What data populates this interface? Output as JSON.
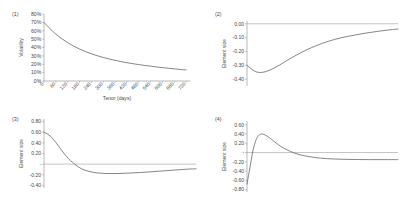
{
  "figure": {
    "background": "#ffffff",
    "curve_color": "#5c5c5c",
    "axis_color": "#8a8a8a",
    "text_color": "#4a4a4a"
  },
  "panels": [
    {
      "tag": "(1)",
      "ylabel": "Volatility",
      "xlabel": "Tenor (days)",
      "yticks": [
        "80%",
        "70%",
        "60%",
        "50%",
        "40%",
        "30%",
        "20%",
        "10%",
        "0%"
      ],
      "xticks": [
        "0",
        "60",
        "120",
        "180",
        "240",
        "300",
        "360",
        "420",
        "480",
        "540",
        "600",
        "660",
        "720"
      ]
    },
    {
      "tag": "(2)",
      "ylabel": "Element size",
      "xlabel": "",
      "yticks": [
        "0.00",
        "-0.10",
        "-0.20",
        "-0.30",
        "-0.40"
      ],
      "xticks": []
    },
    {
      "tag": "(3)",
      "ylabel": "Element size",
      "xlabel": "",
      "yticks": [
        "0.80",
        "0.60",
        "0.40",
        "0.20",
        "-",
        "-0.20",
        "-0.40"
      ],
      "xticks": []
    },
    {
      "tag": "(4)",
      "ylabel": "Element size",
      "xlabel": "",
      "yticks": [
        "0.60",
        "0.40",
        "0.20",
        "-",
        "-0.20",
        "-0.40",
        "-0.60",
        "-0.80"
      ],
      "xticks": []
    }
  ],
  "chart_data": [
    {
      "type": "line",
      "panel": "(1)",
      "title": "",
      "xlabel": "Tenor (days)",
      "ylabel": "Volatility",
      "xlim": [
        0,
        740
      ],
      "ylim": [
        0,
        0.8
      ],
      "yticks": [
        0,
        0.1,
        0.2,
        0.3,
        0.4,
        0.5,
        0.6,
        0.7,
        0.8
      ],
      "ytick_labels": [
        "0%",
        "10%",
        "20%",
        "30%",
        "40%",
        "50%",
        "60%",
        "70%",
        "80%"
      ],
      "xticks": [
        0,
        60,
        120,
        180,
        240,
        300,
        360,
        420,
        480,
        540,
        600,
        660,
        720
      ],
      "xtick_labels": [
        "0",
        "60",
        "120",
        "180",
        "240",
        "300",
        "360",
        "420",
        "480",
        "540",
        "600",
        "660",
        "720"
      ],
      "grid": false,
      "legend": null,
      "series": [
        {
          "name": "volatility term structure",
          "x": [
            0,
            30,
            60,
            90,
            120,
            150,
            180,
            210,
            240,
            270,
            300,
            330,
            360,
            390,
            420,
            450,
            480,
            510,
            540,
            570,
            600,
            630,
            660,
            690,
            720
          ],
          "values": [
            0.7,
            0.625,
            0.56,
            0.505,
            0.458,
            0.418,
            0.382,
            0.352,
            0.325,
            0.302,
            0.281,
            0.263,
            0.247,
            0.232,
            0.219,
            0.207,
            0.196,
            0.186,
            0.177,
            0.168,
            0.16,
            0.152,
            0.145,
            0.138,
            0.132
          ]
        }
      ]
    },
    {
      "type": "line",
      "panel": "(2)",
      "title": "",
      "xlabel": "",
      "ylabel": "Element size",
      "xlim": [
        0,
        740
      ],
      "ylim": [
        -0.45,
        0.02
      ],
      "yticks": [
        0.0,
        -0.1,
        -0.2,
        -0.3,
        -0.4
      ],
      "ytick_labels": [
        "0.00",
        "-0.10",
        "-0.20",
        "-0.30",
        "-0.40"
      ],
      "grid": false,
      "legend": null,
      "zeroline": 0.0,
      "series": [
        {
          "name": "element size curve 2",
          "x": [
            0,
            20,
            40,
            60,
            80,
            100,
            130,
            160,
            200,
            240,
            290,
            340,
            400,
            460,
            520,
            580,
            640,
            700,
            740
          ],
          "values": [
            -0.3,
            -0.325,
            -0.345,
            -0.352,
            -0.35,
            -0.342,
            -0.322,
            -0.298,
            -0.262,
            -0.228,
            -0.19,
            -0.158,
            -0.126,
            -0.102,
            -0.084,
            -0.068,
            -0.055,
            -0.044,
            -0.038
          ]
        }
      ]
    },
    {
      "type": "line",
      "panel": "(3)",
      "title": "",
      "xlabel": "",
      "ylabel": "Element size",
      "xlim": [
        0,
        740
      ],
      "ylim": [
        -0.45,
        0.85
      ],
      "yticks": [
        0.8,
        0.6,
        0.4,
        0.2,
        0.0,
        -0.2,
        -0.4
      ],
      "ytick_labels": [
        "0.80",
        "0.60",
        "0.40",
        "0.20",
        "-",
        "-0.20",
        "-0.40"
      ],
      "grid": false,
      "legend": null,
      "zeroline": 0.0,
      "series": [
        {
          "name": "element size curve 3",
          "x": [
            0,
            20,
            40,
            60,
            80,
            100,
            120,
            140,
            170,
            200,
            240,
            290,
            350,
            410,
            470,
            530,
            590,
            650,
            700,
            740
          ],
          "values": [
            0.6,
            0.56,
            0.49,
            0.395,
            0.29,
            0.19,
            0.1,
            0.03,
            -0.06,
            -0.115,
            -0.155,
            -0.175,
            -0.178,
            -0.17,
            -0.158,
            -0.142,
            -0.125,
            -0.108,
            -0.095,
            -0.088
          ]
        }
      ]
    },
    {
      "type": "line",
      "panel": "(4)",
      "title": "",
      "xlabel": "",
      "ylabel": "Element size",
      "xlim": [
        0,
        740
      ],
      "ylim": [
        -0.85,
        0.68
      ],
      "yticks": [
        0.6,
        0.4,
        0.2,
        0.0,
        -0.2,
        -0.4,
        -0.6,
        -0.8
      ],
      "ytick_labels": [
        "0.60",
        "0.40",
        "0.20",
        "-",
        "-0.20",
        "-0.40",
        "-0.60",
        "-0.80"
      ],
      "grid": false,
      "legend": null,
      "zeroline": 0.0,
      "series": [
        {
          "name": "element size curve 4",
          "x": [
            0,
            10,
            20,
            30,
            45,
            60,
            75,
            90,
            110,
            130,
            155,
            180,
            215,
            250,
            300,
            360,
            420,
            480,
            540,
            600,
            660,
            720,
            740
          ],
          "values": [
            -0.68,
            -0.43,
            -0.18,
            0.06,
            0.28,
            0.38,
            0.4,
            0.375,
            0.32,
            0.25,
            0.165,
            0.095,
            0.02,
            -0.035,
            -0.085,
            -0.12,
            -0.138,
            -0.146,
            -0.15,
            -0.152,
            -0.152,
            -0.152,
            -0.152
          ]
        }
      ]
    }
  ]
}
